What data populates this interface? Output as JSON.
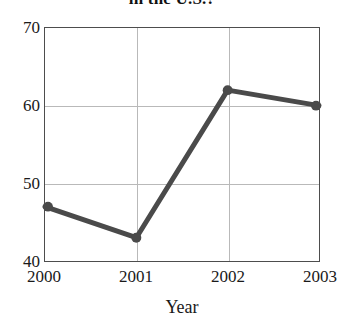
{
  "chart_data": {
    "type": "line",
    "title": "in the U.S.?",
    "xlabel": "Year",
    "ylabel": "",
    "categories": [
      "2000",
      "2001",
      "2002",
      "2003"
    ],
    "values": [
      47,
      43,
      62,
      60
    ],
    "series": [
      {
        "name": "value",
        "values": [
          47,
          43,
          62,
          60
        ]
      }
    ],
    "ylim": [
      40,
      70
    ],
    "yticks": [
      40,
      50,
      60,
      70
    ],
    "ytick_labels": [
      "40",
      "50",
      "60",
      "70"
    ],
    "xticks": [
      "2000",
      "2001",
      "2002",
      "2003"
    ],
    "grid": true,
    "legend": false,
    "legend_position": "none",
    "line_color": "#4a4a4a",
    "marker": "circle",
    "marker_color": "#4a4a4a",
    "grid_color": "#b9b9b9",
    "frame_color": "#4d4d4d",
    "background_color": "#ffffff"
  }
}
